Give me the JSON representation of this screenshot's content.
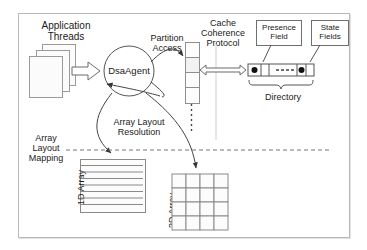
{
  "diagram": {
    "title_region": "DSA agent array layout and cache coherence diagram",
    "labels": {
      "application_threads": "Application\nThreads",
      "dsa_agent": "DsaAgent",
      "partition_access": "Partition\nAccess",
      "cache_coherence_protocol": "Cache\nCoherence\nProtocol",
      "presence_field": "Presence\nField",
      "state_fields": "State\nFields",
      "directory": "Directory",
      "array_layout_resolution": "Array Layout\nResolution",
      "array_layout_mapping": "Array\nLayout\nMapping",
      "one_d_array": "1D Array",
      "two_d_array": "2D Array"
    },
    "structures": {
      "thread_page_count": 3,
      "partition_cell_count": 4,
      "one_d_array_rows": 8,
      "two_d_array_rows": 4,
      "two_d_array_cols": 4,
      "directory_presence_dots": 2
    },
    "colors": {
      "frame_border": "#b9b9b9",
      "stroke": "#444444",
      "cell_fill": "#fdfdfd",
      "page_fill": "#fbfbfb",
      "text": "#1a1a1a"
    }
  }
}
